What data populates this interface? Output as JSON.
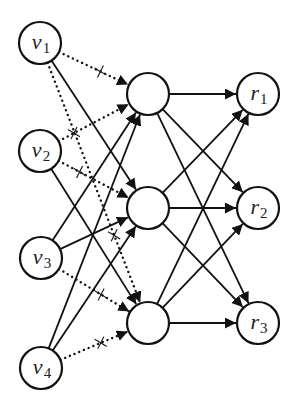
{
  "diagram": {
    "type": "bipartite-neural-network",
    "layers": {
      "input": [
        {
          "id": "v1",
          "base": "v",
          "sub": "1",
          "x": 40,
          "y": 43
        },
        {
          "id": "v2",
          "base": "v",
          "sub": "2",
          "x": 40,
          "y": 151
        },
        {
          "id": "v3",
          "base": "v",
          "sub": "3",
          "x": 41,
          "y": 258
        },
        {
          "id": "v4",
          "base": "v",
          "sub": "4",
          "x": 41,
          "y": 368
        }
      ],
      "hidden": [
        {
          "id": "h1",
          "x": 148,
          "y": 94
        },
        {
          "id": "h2",
          "x": 148,
          "y": 208
        },
        {
          "id": "h3",
          "x": 148,
          "y": 323
        }
      ],
      "output": [
        {
          "id": "r1",
          "base": "r",
          "sub": "1",
          "x": 258,
          "y": 94
        },
        {
          "id": "r2",
          "base": "r",
          "sub": "2",
          "x": 258,
          "y": 208
        },
        {
          "id": "r3",
          "base": "r",
          "sub": "3",
          "x": 258,
          "y": 323
        }
      ]
    },
    "node_radius": 21,
    "edges": [
      {
        "from": "v1",
        "to": "h1",
        "style": "dotted",
        "crossed": true
      },
      {
        "from": "v1",
        "to": "h2",
        "style": "solid",
        "crossed": false
      },
      {
        "from": "v1",
        "to": "h3",
        "style": "dotted",
        "crossed": true
      },
      {
        "from": "v2",
        "to": "h1",
        "style": "dotted",
        "crossed": true
      },
      {
        "from": "v2",
        "to": "h2",
        "style": "dotted",
        "crossed": true
      },
      {
        "from": "v2",
        "to": "h3",
        "style": "solid",
        "crossed": false
      },
      {
        "from": "v3",
        "to": "h1",
        "style": "solid",
        "crossed": false
      },
      {
        "from": "v3",
        "to": "h2",
        "style": "solid",
        "crossed": false
      },
      {
        "from": "v3",
        "to": "h3",
        "style": "dotted",
        "crossed": true
      },
      {
        "from": "v4",
        "to": "h1",
        "style": "solid",
        "crossed": false
      },
      {
        "from": "v4",
        "to": "h2",
        "style": "solid",
        "crossed": false
      },
      {
        "from": "v4",
        "to": "h3",
        "style": "dotted",
        "crossed": true
      },
      {
        "from": "h1",
        "to": "r1",
        "style": "solid",
        "crossed": false
      },
      {
        "from": "h1",
        "to": "r2",
        "style": "solid",
        "crossed": false
      },
      {
        "from": "h1",
        "to": "r3",
        "style": "solid",
        "crossed": false
      },
      {
        "from": "h2",
        "to": "r1",
        "style": "solid",
        "crossed": false
      },
      {
        "from": "h2",
        "to": "r2",
        "style": "solid",
        "crossed": false
      },
      {
        "from": "h2",
        "to": "r3",
        "style": "solid",
        "crossed": false
      },
      {
        "from": "h3",
        "to": "r1",
        "style": "solid",
        "crossed": false
      },
      {
        "from": "h3",
        "to": "r2",
        "style": "solid",
        "crossed": false
      },
      {
        "from": "h3",
        "to": "r3",
        "style": "solid",
        "crossed": false
      }
    ],
    "colors": {
      "stroke": "#111111",
      "background": "#ffffff"
    }
  },
  "labels": {
    "v1": {
      "base": "v",
      "sub": "1"
    },
    "v2": {
      "base": "v",
      "sub": "2"
    },
    "v3": {
      "base": "v",
      "sub": "3"
    },
    "v4": {
      "base": "v",
      "sub": "4"
    },
    "r1": {
      "base": "r",
      "sub": "1"
    },
    "r2": {
      "base": "r",
      "sub": "2"
    },
    "r3": {
      "base": "r",
      "sub": "3"
    }
  }
}
